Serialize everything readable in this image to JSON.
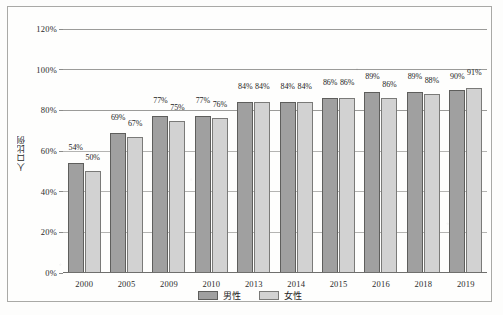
{
  "chart_data": {
    "type": "bar",
    "title": "",
    "xlabel": "",
    "ylabel": "人口比例",
    "ylim": [
      0,
      120
    ],
    "ytick_labels": [
      "0%",
      "20%",
      "40%",
      "60%",
      "80%",
      "100%",
      "120%"
    ],
    "ytick_values": [
      0,
      20,
      40,
      60,
      80,
      100,
      120
    ],
    "grid": true,
    "legend_position": "bottom-center",
    "categories": [
      "2000",
      "2005",
      "2009",
      "2010",
      "2013",
      "2014",
      "2015",
      "2016",
      "2018",
      "2019"
    ],
    "series": [
      {
        "name": "男性",
        "color": "#a0a0a0",
        "values": [
          54,
          69,
          77,
          77,
          84,
          84,
          86,
          89,
          89,
          90
        ],
        "labels": [
          "54%",
          "69%",
          "77%",
          "77%",
          "84%",
          "84%",
          "86%",
          "89%",
          "89%",
          "90%"
        ]
      },
      {
        "name": "女性",
        "color": "#d2d2d2",
        "values": [
          50,
          67,
          75,
          76,
          84,
          84,
          86,
          86,
          88,
          91
        ],
        "labels": [
          "50%",
          "67%",
          "75%",
          "76%",
          "84%",
          "84%",
          "86%",
          "86%",
          "88%",
          "91%"
        ]
      }
    ]
  }
}
